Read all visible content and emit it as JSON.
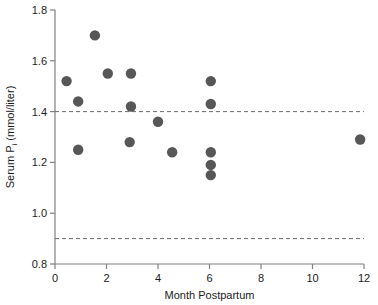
{
  "chart_data": {
    "type": "scatter",
    "title": "",
    "xlabel": "Month Postpartum",
    "ylabel": "Serum P",
    "ylabel_sub": "i",
    "ylabel_units": "(mmol/liter)",
    "xlim": [
      0,
      12
    ],
    "ylim": [
      0.8,
      1.8
    ],
    "xticks": [
      0,
      2,
      4,
      6,
      8,
      10,
      12
    ],
    "xtick_labels": [
      "0",
      "2",
      "4",
      "6",
      "8",
      "10",
      "12"
    ],
    "yticks": [
      0.8,
      1.0,
      1.2,
      1.4,
      1.6,
      1.8
    ],
    "ytick_labels": [
      "0.8",
      "1.0",
      "1.2",
      "1.4",
      "1.6",
      "1.8"
    ],
    "grid": false,
    "legend": false,
    "point_color": "#575757",
    "axis_color": "#808080",
    "reference_lines": [
      {
        "name": "upper-reference-limit",
        "y": 1.4,
        "style": "dashed",
        "color": "#6b6b6b"
      },
      {
        "name": "lower-reference-limit",
        "y": 0.9,
        "style": "dashed",
        "color": "#6b6b6b"
      }
    ],
    "points": [
      {
        "x": 0.45,
        "y": 1.52
      },
      {
        "x": 0.9,
        "y": 1.44
      },
      {
        "x": 0.9,
        "y": 1.25
      },
      {
        "x": 1.55,
        "y": 1.7
      },
      {
        "x": 2.05,
        "y": 1.55
      },
      {
        "x": 2.95,
        "y": 1.55
      },
      {
        "x": 2.95,
        "y": 1.42
      },
      {
        "x": 2.9,
        "y": 1.28
      },
      {
        "x": 4.0,
        "y": 1.36
      },
      {
        "x": 4.55,
        "y": 1.24
      },
      {
        "x": 6.05,
        "y": 1.52
      },
      {
        "x": 6.05,
        "y": 1.43
      },
      {
        "x": 6.05,
        "y": 1.24
      },
      {
        "x": 6.05,
        "y": 1.19
      },
      {
        "x": 6.05,
        "y": 1.15
      },
      {
        "x": 11.85,
        "y": 1.29
      }
    ]
  }
}
